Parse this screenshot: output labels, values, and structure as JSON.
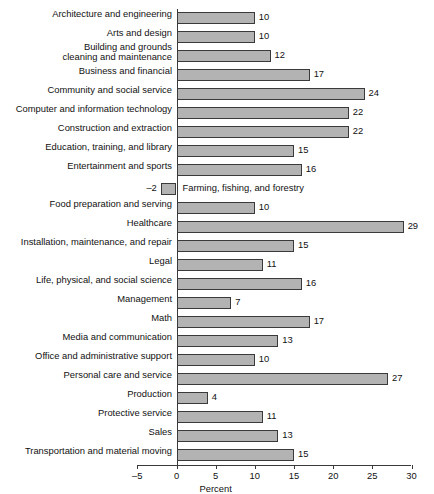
{
  "chart_data": {
    "type": "bar",
    "orientation": "horizontal",
    "title": "",
    "xlabel": "Percent",
    "ylabel": "",
    "xlim": [
      -5,
      30
    ],
    "xticks": [
      -5,
      0,
      5,
      10,
      15,
      20,
      25,
      30
    ],
    "xtick_labels": [
      "–5",
      "0",
      "5",
      "10",
      "15",
      "20",
      "25",
      "30"
    ],
    "grid": false,
    "legend": null,
    "bar_color": "#b3b3b3",
    "bar_edge_color": "#3a3a3a",
    "categories": [
      "Architecture and engineering",
      "Arts and design",
      "Building and grounds\ncleaning and maintenance",
      "Business and financial",
      "Community and social service",
      "Computer and information technology",
      "Construction and extraction",
      "Education, training, and library",
      "Entertainment and sports",
      "Farming, fishing, and forestry",
      "Food preparation and serving",
      "Healthcare",
      "Installation, maintenance, and repair",
      "Legal",
      "Life, physical, and social science",
      "Management",
      "Math",
      "Media and communication",
      "Office and administrative support",
      "Personal care and service",
      "Production",
      "Protective service",
      "Sales",
      "Transportation and material moving"
    ],
    "values": [
      10,
      10,
      12,
      17,
      24,
      22,
      22,
      15,
      16,
      -2,
      10,
      29,
      15,
      11,
      16,
      7,
      17,
      13,
      10,
      27,
      4,
      11,
      13,
      15
    ],
    "value_labels": [
      "10",
      "10",
      "12",
      "17",
      "24",
      "22",
      "22",
      "15",
      "16",
      "–2",
      "10",
      "29",
      "15",
      "11",
      "16",
      "7",
      "17",
      "13",
      "10",
      "27",
      "4",
      "11",
      "13",
      "15"
    ]
  }
}
